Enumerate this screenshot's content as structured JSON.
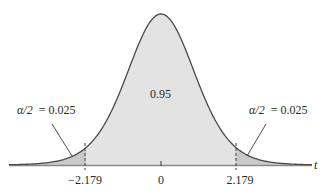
{
  "chart_data": {
    "type": "area",
    "title": "",
    "xlabel": "t",
    "ylabel": "",
    "distribution": "Student t (approx. 12 df)",
    "x_ticks": [
      {
        "value": -2.179,
        "label": "−2.179"
      },
      {
        "value": 0,
        "label": "0"
      },
      {
        "value": 2.179,
        "label": "2.179"
      }
    ],
    "critical_values": [
      -2.179,
      2.179
    ],
    "regions": [
      {
        "name": "left-tail",
        "range": [
          "-inf",
          -2.179
        ],
        "area": 0.025,
        "label": "α/2 = 0.025",
        "color": "#c9c9c9"
      },
      {
        "name": "center",
        "range": [
          -2.179,
          2.179
        ],
        "area": 0.95,
        "label": "0.95",
        "color": "#e3e3e3"
      },
      {
        "name": "right-tail",
        "range": [
          2.179,
          "inf"
        ],
        "area": 0.025,
        "label": "α/2 = 0.025",
        "color": "#c9c9c9"
      }
    ],
    "grid": false,
    "legend": "none"
  },
  "labels": {
    "center_area": "0.95",
    "left_tail_alpha": "α/2",
    "left_tail_value": "= 0.025",
    "right_tail_alpha": "α/2",
    "right_tail_value": "= 0.025",
    "axis_var": "t",
    "tick_neg": "−2.179",
    "tick_zero": "0",
    "tick_pos": "2.179"
  },
  "colors": {
    "curve": "#4a4a4a",
    "axis": "#8a8a8a",
    "center_fill": "#e3e3e3",
    "tail_fill": "#c9c9c9",
    "text": "#2a2a2a"
  }
}
